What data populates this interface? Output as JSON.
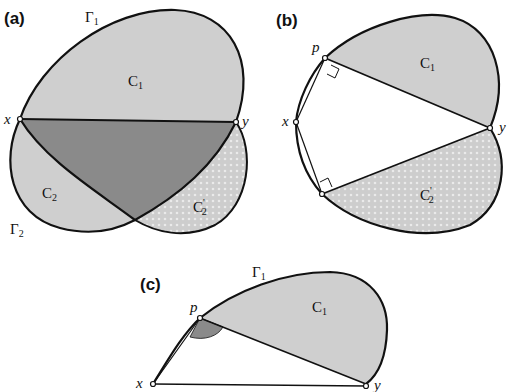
{
  "figure": {
    "panels": [
      {
        "id": "a",
        "label": "(a)",
        "points": {
          "x": "x",
          "y": "y"
        },
        "curves": {
          "gamma1": "Γ",
          "gamma1_sub": "1",
          "gamma2": "Γ",
          "gamma2_sub": "2"
        },
        "regions": {
          "c1": "C",
          "c1_sub": "1",
          "c2": "C",
          "c2_sub": "2",
          "c2prime": "C",
          "c2prime_sub": "2",
          "c2prime_mark": "'"
        }
      },
      {
        "id": "b",
        "label": "(b)",
        "points": {
          "p": "p",
          "x": "x",
          "y": "y"
        },
        "regions": {
          "c1": "C",
          "c1_sub": "1",
          "c2prime": "C",
          "c2prime_sub": "2",
          "c2prime_mark": "'"
        }
      },
      {
        "id": "c",
        "label": "(c)",
        "points": {
          "p": "p",
          "x": "x",
          "y": "y"
        },
        "curves": {
          "gamma1": "Γ",
          "gamma1_sub": "1"
        },
        "regions": {
          "c1": "C",
          "c1_sub": "1"
        }
      }
    ],
    "colors": {
      "light_fill": "#cfcfcf",
      "dark_fill": "#8a8a8a",
      "dotted_fill": "#d8d8d8",
      "stroke": "#111111"
    }
  }
}
